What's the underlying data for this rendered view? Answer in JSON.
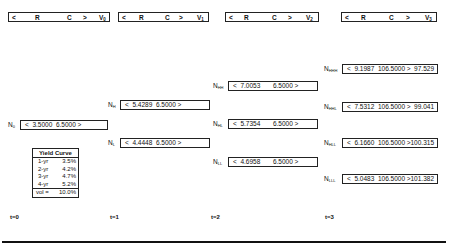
{
  "headers": [
    {
      "lt": "<",
      "r": "R",
      "c": "C",
      "gt": ">",
      "v": "V",
      "sub": "0"
    },
    {
      "lt": "<",
      "r": "R",
      "c": "C",
      "gt": ">",
      "v": "V",
      "sub": "1"
    },
    {
      "lt": "<",
      "r": "R",
      "c": "C",
      "gt": ">",
      "v": "V",
      "sub": "2"
    },
    {
      "lt": "<",
      "r": "R",
      "c": "C",
      "gt": ">",
      "v": "V",
      "sub": "3"
    }
  ],
  "nodes": {
    "n0": {
      "label": "N",
      "sub": "0",
      "text": "<  3.5000  6.5000 >",
      "value": ""
    },
    "nH": {
      "label": "N",
      "sub": "H",
      "text": "<  5.4289  6.5000 >",
      "value": ""
    },
    "nL": {
      "label": "N",
      "sub": "L",
      "text": "<  4.4448  6.5000 >",
      "value": ""
    },
    "nHH": {
      "label": "N",
      "sub": "HH",
      "text": "<  7.0053       6.5000 >",
      "value": ""
    },
    "nHL": {
      "label": "N",
      "sub": "HL",
      "text": "<  5.7354       6.5000 >",
      "value": ""
    },
    "nLL": {
      "label": "N",
      "sub": "LL",
      "text": "<  4.6958       6.5000 >",
      "value": ""
    },
    "nHHH": {
      "label": "N",
      "sub": "HHH",
      "text": "<  9.1987  106.5000 >",
      "value": "97.529"
    },
    "nHHL": {
      "label": "N",
      "sub": "HHL",
      "text": "<  7.5312  106.5000 >",
      "value": "99.041"
    },
    "nHLL": {
      "label": "N",
      "sub": "HLL",
      "text": "<  6.1660  106.5000 >",
      "value": "100.315"
    },
    "nLLL": {
      "label": "N",
      "sub": "LLL",
      "text": "<  5.0483  106.5000 >",
      "value": "101.382"
    }
  },
  "yield_curve": {
    "title": "Yield Curve",
    "rows": [
      {
        "term": "1-yr",
        "rate": "3.5%"
      },
      {
        "term": "2-yr",
        "rate": "4.2%"
      },
      {
        "term": "3-yr",
        "rate": "4.7%"
      },
      {
        "term": "4-yr",
        "rate": "5.2%"
      }
    ],
    "vol_label": "vol =",
    "vol_value": "10.0%"
  },
  "time_labels": [
    "t=0",
    "t=1",
    "t=2",
    "t=3"
  ]
}
